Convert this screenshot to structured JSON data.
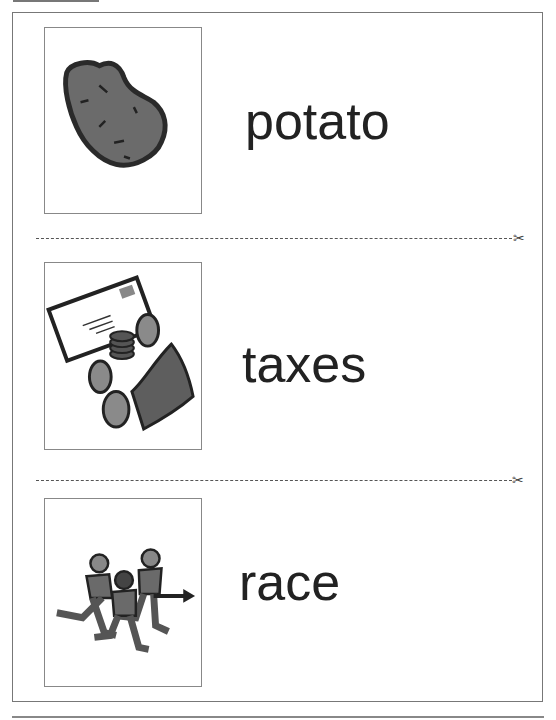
{
  "cards": [
    {
      "word": "potato",
      "picture": "potato-icon"
    },
    {
      "word": "taxes",
      "picture": "taxes-icon"
    },
    {
      "word": "race",
      "picture": "race-icon"
    }
  ],
  "cut_lines": [
    {
      "icon": "scissors-icon",
      "glyph": "✂"
    },
    {
      "icon": "scissors-icon",
      "glyph": "✂"
    }
  ]
}
